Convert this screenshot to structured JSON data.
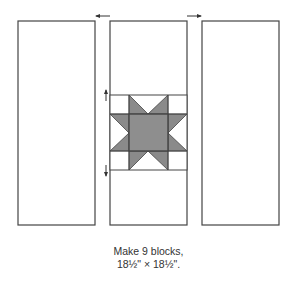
{
  "diagram": {
    "columns": [
      {
        "name": "left-strip",
        "fill": "#ffffff"
      },
      {
        "name": "center-strip-with-star",
        "fill": "#ffffff"
      },
      {
        "name": "right-strip",
        "fill": "#ffffff"
      }
    ],
    "star_block": {
      "fill": "#8a8a8a",
      "center_fill": "#8e8e8e",
      "background": "#ffffff"
    },
    "pressing_arrows": [
      "left-arrow-top",
      "right-arrow-top",
      "up-arrow",
      "down-arrow"
    ]
  },
  "caption": {
    "line1": "Make 9 blocks,",
    "line2": "18½\" × 18½\"."
  },
  "colors": {
    "stroke": "#444444",
    "star": "#8a8a8a"
  }
}
